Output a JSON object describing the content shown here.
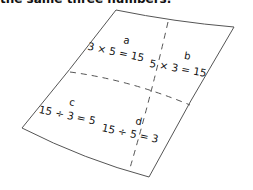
{
  "caption": "the same three numbers.",
  "cells": [
    {
      "letter": "a",
      "equation": "3 × 5 = 15"
    },
    {
      "letter": "b",
      "equation": "5 × 3 = 15"
    },
    {
      "letter": "c",
      "equation": "15 ÷ 3 = 5"
    },
    {
      "letter": "d",
      "equation": "15 ÷ 5 = 3"
    }
  ],
  "colors": {
    "ink": "#111111",
    "paper": "#ffffff",
    "outline": "#555555"
  }
}
